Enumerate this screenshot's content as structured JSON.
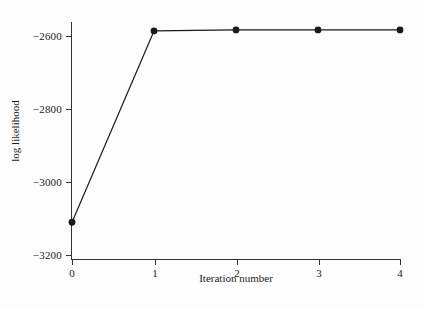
{
  "chart_data": {
    "type": "line",
    "title": "",
    "xlabel": "Iteration number",
    "ylabel": "log likelihood",
    "x": [
      0,
      1,
      2,
      3,
      4
    ],
    "values": [
      -3143,
      -2586,
      -2583,
      -2583,
      -2583
    ],
    "series": [
      {
        "name": "log likelihood",
        "x": [
          0,
          1,
          2,
          3,
          4
        ],
        "values": [
          -3143,
          -2586,
          -2583,
          -2583,
          -2583
        ]
      }
    ],
    "xlim": [
      0,
      4
    ],
    "ylim": [
      -3250,
      -2560
    ],
    "xticks": [
      "0",
      "1",
      "2",
      "3",
      "4"
    ],
    "yticks": [
      "−2600",
      "−2800",
      "−3000",
      "−3200"
    ],
    "ytick_values": [
      -2600,
      -2800,
      -3000,
      -3200
    ],
    "grid": false,
    "legend": "none",
    "marker": "filled-circle",
    "line_color": "#1a1a1a",
    "marker_color": "#1a1a1a",
    "background_color": "#fdfdfd"
  }
}
